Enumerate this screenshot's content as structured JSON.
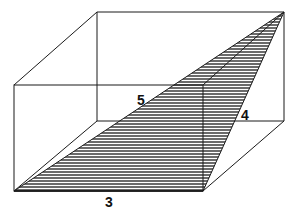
{
  "diagram": {
    "type": "rectangular-prism",
    "labels": {
      "diagonal": "5",
      "side": "4",
      "base": "3"
    },
    "colors": {
      "stroke": "#1a1a1a",
      "shade": "#6b6b6b",
      "background": "#ffffff"
    }
  }
}
